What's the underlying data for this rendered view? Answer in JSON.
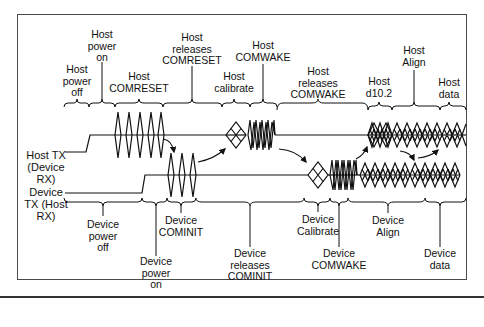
{
  "diagram": {
    "type": "timing-diagram",
    "signals": [
      {
        "id": "host_tx",
        "label": "Host TX\n(Device\nRX)"
      },
      {
        "id": "device_tx",
        "label": "Device\nTX (Host\nRX)"
      }
    ],
    "host_events": [
      {
        "id": "host_power_off",
        "label": "Host\npower\noff"
      },
      {
        "id": "host_power_on",
        "label": "Host\npower\non"
      },
      {
        "id": "host_comreset",
        "label": "Host\nCOMRESET"
      },
      {
        "id": "host_releases_comreset",
        "label": "Host\nreleases\nCOMRESET"
      },
      {
        "id": "host_calibrate",
        "label": "Host\ncalibrate"
      },
      {
        "id": "host_comwake",
        "label": "Host\nCOMWAKE"
      },
      {
        "id": "host_releases_comwake",
        "label": "Host\nreleases\nCOMWAKE"
      },
      {
        "id": "host_d10_2",
        "label": "Host\nd10.2"
      },
      {
        "id": "host_align",
        "label": "Host\nAlign"
      },
      {
        "id": "host_data",
        "label": "Host\ndata"
      }
    ],
    "device_events": [
      {
        "id": "device_power_off",
        "label": "Device\npower\noff"
      },
      {
        "id": "device_power_on",
        "label": "Device\npower\non"
      },
      {
        "id": "device_cominit",
        "label": "Device\nCOMINIT"
      },
      {
        "id": "device_releases_cominit",
        "label": "Device\nreleases\nCOMINIT"
      },
      {
        "id": "device_calibrate",
        "label": "Device\nCalibrate"
      },
      {
        "id": "device_comwake",
        "label": "Device\nCOMWAKE"
      },
      {
        "id": "device_align",
        "label": "Device\nAlign"
      },
      {
        "id": "device_data",
        "label": "Device\ndata"
      }
    ]
  }
}
